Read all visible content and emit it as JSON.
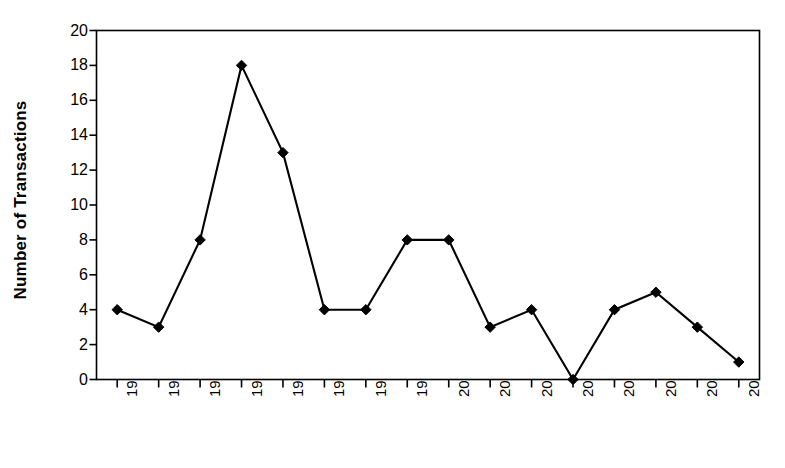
{
  "chart_data": {
    "type": "line",
    "title": "",
    "subtitle": "",
    "xlabel": "",
    "ylabel": "Number of Transactions",
    "categories": [
      "1992",
      "1993",
      "1994",
      "1995",
      "1996",
      "1997",
      "1998",
      "1999",
      "2000",
      "2001",
      "2002",
      "2003",
      "2004",
      "2005",
      "2006",
      "2007"
    ],
    "values": [
      4,
      3,
      8,
      18,
      13,
      4,
      4,
      8,
      8,
      3,
      4,
      0,
      4,
      5,
      3,
      1
    ],
    "series": [
      {
        "name": "Number of Transactions",
        "values": [
          4,
          3,
          8,
          18,
          13,
          4,
          4,
          8,
          8,
          3,
          4,
          0,
          4,
          5,
          3,
          1
        ]
      }
    ],
    "ylim": [
      0,
      20
    ],
    "y_ticks": [
      0,
      2,
      4,
      6,
      8,
      10,
      12,
      14,
      16,
      18,
      20
    ],
    "y_tick_labels": [
      "0",
      "2",
      "4",
      "6",
      "8",
      "10",
      "12",
      "14",
      "16",
      "18",
      "20"
    ],
    "grid": false,
    "legend": false,
    "legend_position": "none",
    "marker": "diamond",
    "marker_color": "#000000",
    "line_color": "#000000",
    "plot_background": "#ffffff",
    "frame": true
  }
}
